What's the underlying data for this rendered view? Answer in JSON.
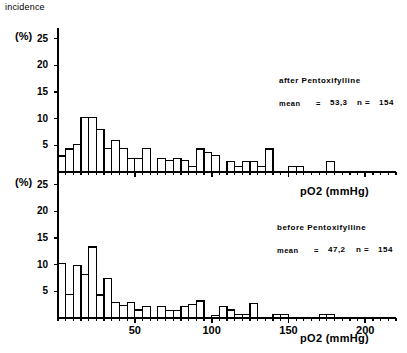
{
  "figure": {
    "incidence_label": "incidence",
    "y_axis_label_top": "(%)",
    "y_axis_label_bottom": "(%)",
    "axis_label_mid": "pO2  (mmHg)",
    "axis_label_bottom": "pO2  (mmHg)"
  },
  "chart_data": [
    {
      "type": "bar",
      "title": "after Pentoxifylline",
      "panel": "top",
      "xlabel": "pO2 (mmHg)",
      "ylabel": "incidence (%)",
      "xlim": [
        0,
        220
      ],
      "ylim": [
        0,
        27
      ],
      "bin_width": 5,
      "grid": false,
      "legend": "none",
      "y_ticks": [
        5,
        10,
        15,
        20,
        25
      ],
      "x_ticks": [
        0,
        5,
        10,
        15,
        20,
        25,
        30,
        35,
        40,
        45,
        50,
        55,
        60,
        65,
        70,
        75,
        80,
        85,
        90,
        95,
        100,
        105,
        110,
        115,
        120,
        125,
        130,
        135,
        140,
        145,
        150,
        155,
        160,
        165,
        170,
        175,
        180,
        185,
        190,
        195,
        200,
        205,
        210,
        215,
        220
      ],
      "x_tick_labels": [
        "50",
        "100",
        "150",
        "200"
      ],
      "x_tick_label_values": [
        50,
        100,
        150,
        200
      ],
      "annotations": {
        "group": "after  Pentoxifylline",
        "stat_label": "mean",
        "stat_eq": "=",
        "mean": "53,3",
        "n_label": "n =",
        "n": "154"
      },
      "categories": [
        0,
        5,
        10,
        15,
        20,
        25,
        30,
        35,
        40,
        45,
        50,
        55,
        60,
        65,
        70,
        75,
        80,
        85,
        90,
        95,
        100,
        105,
        110,
        115,
        120,
        125,
        130,
        135,
        140,
        145,
        150,
        155,
        160,
        165,
        170,
        175,
        180,
        185,
        190,
        195,
        200,
        205,
        210,
        215
      ],
      "values": [
        3.0,
        4.3,
        5.1,
        10.2,
        10.2,
        8.0,
        4.4,
        5.9,
        4.4,
        2.6,
        2.6,
        4.4,
        0.0,
        2.5,
        2.1,
        2.5,
        2.1,
        1.0,
        4.3,
        3.7,
        3.1,
        0.0,
        2.0,
        1.0,
        2.0,
        2.0,
        1.0,
        4.3,
        0.0,
        0.0,
        1.0,
        1.0,
        0.0,
        0.0,
        0.0,
        2.0,
        0.0,
        0.0,
        0.0,
        0.0,
        0.0,
        0.0,
        0.0,
        0.0
      ]
    },
    {
      "type": "bar",
      "title": "before Pentoxifylline",
      "panel": "bottom",
      "xlabel": "pO2 (mmHg)",
      "ylabel": "incidence (%)",
      "xlim": [
        0,
        220
      ],
      "ylim": [
        0,
        27
      ],
      "bin_width": 5,
      "grid": false,
      "legend": "none",
      "y_ticks": [
        5,
        10,
        15,
        20,
        25
      ],
      "x_ticks": [
        0,
        5,
        10,
        15,
        20,
        25,
        30,
        35,
        40,
        45,
        50,
        55,
        60,
        65,
        70,
        75,
        80,
        85,
        90,
        95,
        100,
        105,
        110,
        115,
        120,
        125,
        130,
        135,
        140,
        145,
        150,
        155,
        160,
        165,
        170,
        175,
        180,
        185,
        190,
        195,
        200,
        205,
        210,
        215,
        220
      ],
      "x_tick_labels": [
        "50",
        "100",
        "150",
        "200"
      ],
      "x_tick_label_values": [
        50,
        100,
        150,
        200
      ],
      "annotations": {
        "group": "before  Pentoxifylline",
        "stat_label": "mean",
        "stat_eq": "=",
        "mean": "47,2",
        "n_label": "n =",
        "n": "154"
      },
      "categories": [
        0,
        5,
        10,
        15,
        20,
        25,
        30,
        35,
        40,
        45,
        50,
        55,
        60,
        65,
        70,
        75,
        80,
        85,
        90,
        95,
        100,
        105,
        110,
        115,
        120,
        125,
        130,
        135,
        140,
        145,
        150,
        155,
        160,
        165,
        170,
        175,
        180,
        185,
        190,
        195,
        200,
        205,
        210,
        215
      ],
      "values": [
        10.2,
        4.4,
        9.9,
        8.2,
        13.3,
        4.3,
        7.4,
        2.9,
        2.4,
        2.9,
        1.5,
        2.2,
        0.0,
        2.1,
        1.4,
        1.4,
        2.2,
        2.6,
        3.2,
        0.0,
        0.5,
        2.1,
        1.5,
        0.6,
        0.6,
        2.7,
        0.0,
        0.0,
        0.7,
        0.7,
        0.0,
        0.0,
        0.0,
        0.0,
        0.6,
        0.6,
        0.0,
        0.0,
        0.0,
        0.0,
        0.0,
        0.0,
        0.0,
        0.0
      ]
    }
  ],
  "colors": {
    "ink": "#000000",
    "background": "#ffffff",
    "bar_fill": "#ffffff",
    "bar_stroke": "#000000"
  }
}
